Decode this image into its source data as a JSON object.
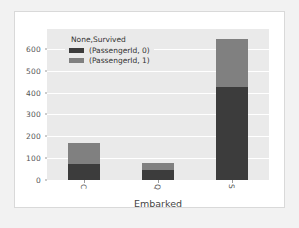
{
  "figure": {
    "background_color": "#ffffff",
    "page_background_color": "#f2f2f2",
    "plot_background_color": "#eaeaea",
    "grid_color": "#ffffff"
  },
  "legend": {
    "title": "None,Survived",
    "entries": [
      {
        "label": "(PassengerId, 0)",
        "color": "#3c3c3c"
      },
      {
        "label": "(PassengerId, 1)",
        "color": "#808080"
      }
    ]
  },
  "axes": {
    "xlabel": "Embarked",
    "ylabel": "",
    "yticks": [
      "0",
      "100",
      "200",
      "300",
      "400",
      "500",
      "600"
    ],
    "xticks": [
      "C",
      "Q",
      "S"
    ]
  },
  "chart_data": {
    "type": "bar",
    "stacked": true,
    "title": "",
    "xlabel": "Embarked",
    "ylabel": "",
    "categories": [
      "C",
      "Q",
      "S"
    ],
    "series": [
      {
        "name": "(PassengerId, 0)",
        "values": [
          75,
          47,
          427
        ],
        "color": "#3c3c3c"
      },
      {
        "name": "(PassengerId, 1)",
        "values": [
          93,
          30,
          217
        ],
        "color": "#808080"
      }
    ],
    "totals": [
      168,
      77,
      644
    ],
    "ylim": [
      0,
      690
    ],
    "yticks": [
      0,
      100,
      200,
      300,
      400,
      500,
      600
    ],
    "grid": true,
    "grid_axis": "y",
    "legend_position": "upper left",
    "xtick_rotation": 90
  }
}
